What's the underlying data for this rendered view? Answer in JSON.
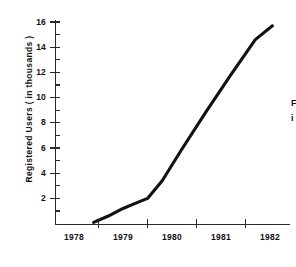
{
  "chart_data": {
    "type": "line",
    "title": "",
    "xlabel": "",
    "ylabel": "Registered Users ( in thousands )",
    "xlim": [
      1977.6,
      1982.6
    ],
    "ylim": [
      0,
      17
    ],
    "grid": false,
    "legend": null,
    "x_tick_labels": [
      "1978",
      "1979",
      "1980",
      "1981",
      "1982"
    ],
    "x_tick_values": [
      1978,
      1979,
      1980,
      1981,
      1982
    ],
    "x_minor_tick_values": [
      1978.5,
      1979.5,
      1980.5,
      1981.5
    ],
    "y_tick_labels": [
      "2",
      "4",
      "6",
      "8",
      "10",
      "12",
      "14",
      "16"
    ],
    "y_tick_values": [
      2,
      4,
      6,
      8,
      10,
      12,
      14,
      16
    ],
    "y_minor_tick_values": [
      1,
      3,
      5,
      7,
      9,
      11,
      13,
      15
    ],
    "series": [
      {
        "name": "Registered Users",
        "color": "#111111",
        "x": [
          1978.4,
          1978.7,
          1979.0,
          1979.25,
          1979.5,
          1979.8,
          1980.2,
          1980.7,
          1981.2,
          1981.7,
          1982.05
        ],
        "values": [
          0.1,
          0.6,
          1.2,
          1.6,
          2.0,
          3.4,
          5.9,
          8.9,
          11.8,
          14.6,
          15.7
        ]
      }
    ]
  },
  "side_note": {
    "line1": "F",
    "line2": "i"
  },
  "colors": {
    "line": "#111111",
    "axis": "#2b2b2b",
    "text": "#111111",
    "background": "#ffffff"
  }
}
